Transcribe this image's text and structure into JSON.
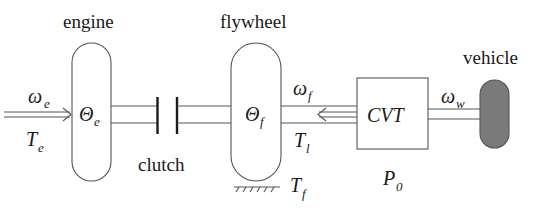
{
  "diagram": {
    "type": "powertrain-schematic",
    "colors": {
      "line": "#555555",
      "text": "#1a1a1a",
      "vehicle_fill": "#7a7a7a",
      "background": "#ffffff"
    },
    "components": {
      "engine": {
        "label": "engine",
        "inertia_symbol": "Θ",
        "inertia_sub": "e"
      },
      "clutch": {
        "label": "clutch"
      },
      "flywheel": {
        "label": "flywheel",
        "inertia_symbol": "Θ",
        "inertia_sub": "f"
      },
      "cvt": {
        "label": "CVT",
        "power_symbol": "P",
        "power_sub": "0"
      },
      "vehicle": {
        "label": "vehicle"
      }
    },
    "signals": {
      "engine_speed": {
        "symbol": "ω",
        "sub": "e"
      },
      "engine_torque": {
        "symbol": "T",
        "sub": "e"
      },
      "flywheel_speed": {
        "symbol": "ω",
        "sub": "f"
      },
      "load_torque": {
        "symbol": "T",
        "sub": "l"
      },
      "friction_torque": {
        "symbol": "T",
        "sub": "f"
      },
      "wheel_speed": {
        "symbol": "ω",
        "sub": "w"
      }
    }
  }
}
